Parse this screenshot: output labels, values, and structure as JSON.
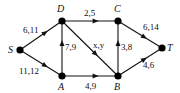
{
  "diagram": {
    "type": "flow-network",
    "nodes": [
      {
        "id": "S",
        "label": "S",
        "x": 20,
        "y": 50,
        "lx": 8,
        "ly": 53
      },
      {
        "id": "D",
        "label": "D",
        "x": 62,
        "y": 21,
        "lx": 57,
        "ly": 12
      },
      {
        "id": "A",
        "label": "A",
        "x": 62,
        "y": 76,
        "lx": 58,
        "ly": 90
      },
      {
        "id": "C",
        "label": "C",
        "x": 118,
        "y": 21,
        "lx": 114,
        "ly": 12
      },
      {
        "id": "B",
        "label": "B",
        "x": 118,
        "y": 76,
        "lx": 114,
        "ly": 90
      },
      {
        "id": "T",
        "label": "T",
        "x": 162,
        "y": 48,
        "lx": 167,
        "ly": 51
      }
    ],
    "edges": [
      {
        "from": "S",
        "to": "D",
        "label": "6,11",
        "lx": 23,
        "ly": 33
      },
      {
        "from": "S",
        "to": "A",
        "label": "11,12",
        "lx": 19,
        "ly": 74
      },
      {
        "from": "D",
        "to": "C",
        "label": "2,5",
        "lx": 84,
        "ly": 16
      },
      {
        "from": "A",
        "to": "D",
        "label": "7,9",
        "lx": 65,
        "ly": 50
      },
      {
        "from": "D",
        "to": "B",
        "label": "x,y",
        "lx": 93,
        "ly": 48
      },
      {
        "from": "A",
        "to": "B",
        "label": "4,9",
        "lx": 85,
        "ly": 89
      },
      {
        "from": "B",
        "to": "C",
        "label": "3,8",
        "lx": 121,
        "ly": 50
      },
      {
        "from": "C",
        "to": "T",
        "label": "6,14",
        "lx": 143,
        "ly": 30
      },
      {
        "from": "B",
        "to": "T",
        "label": "4,6",
        "lx": 143,
        "ly": 68
      }
    ]
  }
}
